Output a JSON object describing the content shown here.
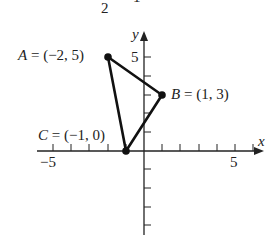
{
  "header": {
    "fragment_2": "2",
    "fragment_1": "1"
  },
  "axes": {
    "x_label": "x",
    "y_label": "y",
    "x_tick_labels": [
      "−5",
      "5"
    ],
    "y_tick_labels": [
      "5"
    ],
    "x_range": [
      -5,
      6
    ],
    "y_range": [
      -4,
      6
    ]
  },
  "points": [
    {
      "name": "A",
      "label": "A = (−2, 5)",
      "x": -2,
      "y": 5
    },
    {
      "name": "B",
      "label": "B = (1, 3)",
      "x": 1,
      "y": 3
    },
    {
      "name": "C",
      "label": "C = (−1, 0)",
      "x": -1,
      "y": 0
    }
  ],
  "shape": "triangle ABC",
  "colors": {
    "stroke": "#111111",
    "text": "#222222"
  }
}
